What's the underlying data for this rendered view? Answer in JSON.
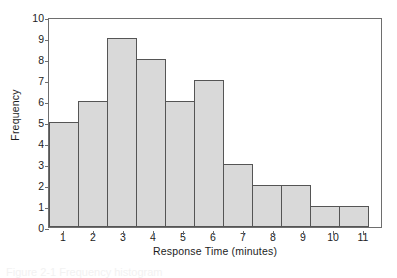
{
  "chart_data": {
    "type": "bar",
    "title": "",
    "subtitle": "",
    "xlabel": "Response Time (minutes)",
    "ylabel": "Frequency",
    "categories": [
      "1",
      "2",
      "3",
      "4",
      "5",
      "6",
      "7",
      "8",
      "9",
      "10",
      "11"
    ],
    "values": [
      5,
      6,
      9,
      8,
      6,
      7,
      3,
      2,
      2,
      1,
      1
    ],
    "ylim": [
      0,
      10
    ],
    "ytick_labels": [
      "0",
      "1",
      "2",
      "3",
      "4",
      "5",
      "6",
      "7",
      "8",
      "9",
      "10"
    ],
    "xtick_labels": [
      "1",
      "2",
      "3",
      "4",
      "5",
      "6",
      "7",
      "8",
      "9",
      "10",
      "11"
    ],
    "grid": false,
    "legend": false,
    "legend_position": "none",
    "annotations": [],
    "style": {
      "bar_fill": "#d9d9d9",
      "bar_edge": "#555555",
      "frame": "#6e6e6e",
      "background": "#ffffff",
      "text": "#1c1c1c"
    }
  },
  "caption": {
    "clipped_text": "Figure 2-1   Frequency histogram"
  }
}
